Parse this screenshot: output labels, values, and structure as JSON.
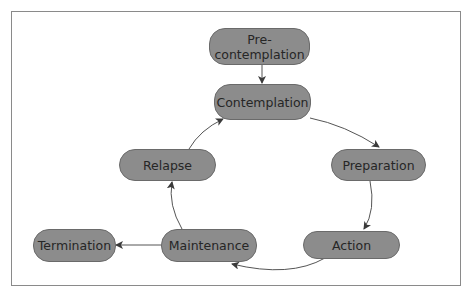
{
  "diagram": {
    "type": "cycle",
    "colors": {
      "node_fill": "#8c8c8c",
      "node_border": "#6a6a6a",
      "node_text": "#262626",
      "edge": "#555555",
      "frame": "#8a8a8a"
    },
    "nodes": {
      "precontemplation": {
        "label_line1": "Pre-",
        "label_line2": "contemplation"
      },
      "contemplation": {
        "label": "Contemplation"
      },
      "preparation": {
        "label": "Preparation"
      },
      "action": {
        "label": "Action"
      },
      "maintenance": {
        "label": "Maintenance"
      },
      "relapse": {
        "label": "Relapse"
      },
      "termination": {
        "label": "Termination"
      }
    },
    "edges": [
      {
        "from": "Pre-contemplation",
        "to": "Contemplation"
      },
      {
        "from": "Contemplation",
        "to": "Preparation"
      },
      {
        "from": "Preparation",
        "to": "Action"
      },
      {
        "from": "Action",
        "to": "Maintenance"
      },
      {
        "from": "Maintenance",
        "to": "Relapse"
      },
      {
        "from": "Relapse",
        "to": "Contemplation"
      },
      {
        "from": "Maintenance",
        "to": "Termination"
      }
    ]
  }
}
